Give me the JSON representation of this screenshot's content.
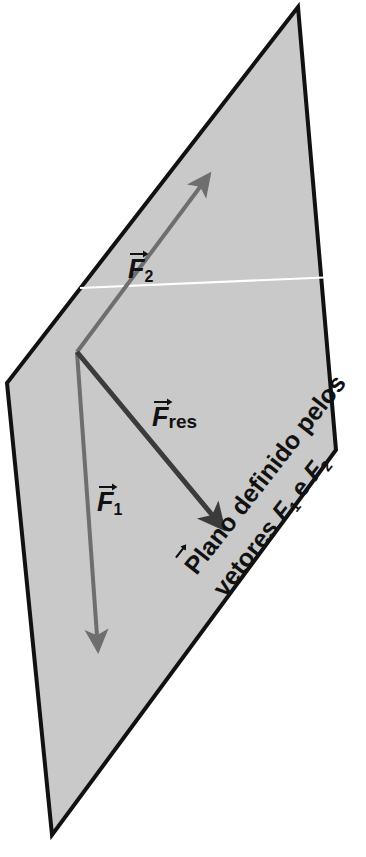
{
  "figure": {
    "kind": "vector-plane-diagram",
    "background_color": "#ffffff",
    "plane": {
      "name": "plane-polygon",
      "fill_color": "#c9c9c9",
      "stroke_color": "#111111",
      "stroke_width": 4,
      "corners": [
        [
          298,
          7
        ],
        [
          336,
          450
        ],
        [
          52,
          835
        ],
        [
          7,
          383
        ]
      ]
    },
    "reference_line": {
      "name": "horizontal-white-line",
      "color": "#ffffff",
      "width": 2,
      "from": [
        80,
        288
      ],
      "to": [
        336,
        277
      ]
    },
    "origin": [
      77,
      352
    ],
    "vectors": [
      {
        "id": "F2",
        "label_text": "F",
        "subscript": "2",
        "color": "#6e6e6e",
        "stroke_width": 4,
        "from": [
          77,
          352
        ],
        "to": [
          213,
          170
        ],
        "label_pos": [
          128,
          262
        ]
      },
      {
        "id": "Fres",
        "label_text": "F",
        "subscript": "res",
        "color": "#3b3b3b",
        "stroke_width": 5,
        "from": [
          77,
          352
        ],
        "to": [
          230,
          537
        ],
        "label_pos": [
          152,
          412
        ]
      },
      {
        "id": "F1",
        "label_text": "F",
        "subscript": "1",
        "color": "#6e6e6e",
        "stroke_width": 4,
        "from": [
          77,
          352
        ],
        "to": [
          99,
          660
        ],
        "label_pos": [
          97,
          495
        ]
      }
    ]
  },
  "labels": {
    "f2": {
      "symbol": "F",
      "subscript": "2"
    },
    "fres": {
      "symbol": "F",
      "subscript": "res"
    },
    "f1": {
      "symbol": "F",
      "subscript": "1"
    }
  },
  "caption": {
    "name": "plane-caption",
    "full_text": "Plano definido pelos vetores F1 e F2",
    "line1": "Plano definido pelos",
    "line2_prefix": "vetores ",
    "line2_sym1": "F",
    "line2_sub1": "1",
    "line2_mid": " e ",
    "line2_sym2": "F",
    "line2_sub2": "2",
    "rotation_deg": -52,
    "color": "#111111"
  }
}
